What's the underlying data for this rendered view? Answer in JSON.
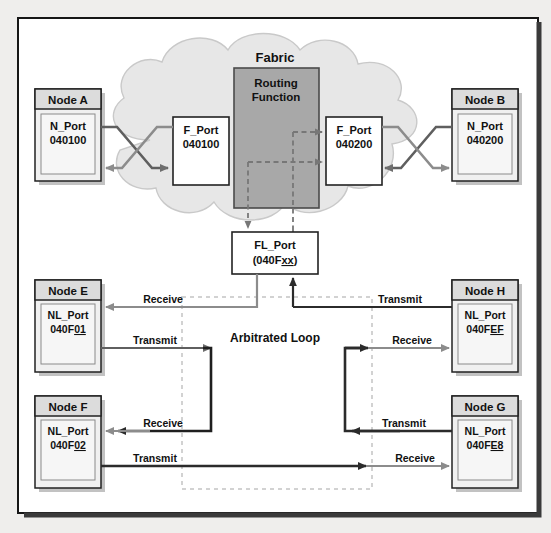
{
  "figure": {
    "type": "network-topology-diagram",
    "background": "#ffffff",
    "frame_color": "#1a1a1a",
    "cloud_label": "Fabric",
    "cloud_fill": "#e7e7e7",
    "routing_label_line1": "Routing",
    "routing_label_line2": "Function",
    "routing_fill": "#a8a8a8",
    "loop_label": "Arbitrated Loop",
    "loop_border_color": "#d2d2d2",
    "dark_line": "#2b2b2b",
    "gray_line": "#8c8c8c",
    "mid_line": "#5f5f5f",
    "node_header_fill": "#dcdcdc",
    "node_body_fill": "#f0f0f0",
    "port_fill": "#ffffff"
  },
  "nodes": {
    "a": {
      "title": "Node A",
      "port_type": "N_Port",
      "port_id": "040100"
    },
    "b": {
      "title": "Node B",
      "port_type": "N_Port",
      "port_id": "040200"
    },
    "e": {
      "title": "Node E",
      "port_type": "NL_Port",
      "port_id_head": "040F",
      "port_id_tail": "01"
    },
    "f": {
      "title": "Node F",
      "port_type": "NL_Port",
      "port_id_head": "040F",
      "port_id_tail": "02"
    },
    "g": {
      "title": "Node G",
      "port_type": "NL_Port",
      "port_id_head": "040F",
      "port_id_tail": "E8"
    },
    "h": {
      "title": "Node H",
      "port_type": "NL_Port",
      "port_id_head": "040F",
      "port_id_tail": "EF"
    }
  },
  "fabric_ports": {
    "f_port_left": {
      "type": "F_Port",
      "id": "040100"
    },
    "f_port_right": {
      "type": "F_Port",
      "id": "040200"
    },
    "fl_port": {
      "type": "FL_Port",
      "id_head": "(040F",
      "id_tail": "xx",
      "id_close": ")"
    }
  },
  "link_labels": {
    "node_e_receive": "Receive",
    "node_e_transmit": "Transmit",
    "node_f_receive": "Receive",
    "node_f_transmit": "Transmit",
    "node_h_transmit": "Transmit",
    "node_h_receive": "Receive",
    "node_g_transmit": "Transmit",
    "node_g_receive": "Receive"
  }
}
